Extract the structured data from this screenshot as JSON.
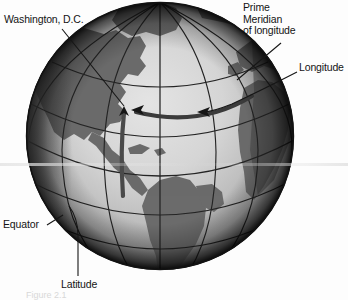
{
  "figure": {
    "type": "diagram",
    "background_color": "#fdfdfd",
    "faint_caption": "Figure 2.1"
  },
  "globe": {
    "center_x": 160,
    "center_y": 136,
    "radius": 134,
    "ocean_light": "#d9d9d9",
    "ocean_mid": "#b9b9b9",
    "land_color": "#6a6a6a",
    "land_dark": "#4e4e4e",
    "limb_dark": "#1d1d1d",
    "grid_color": "#2a2a2a",
    "highlight_color": "#3a3a3a",
    "meridian_count": 7,
    "parallel_count": 5,
    "equator_visible": true,
    "prime_meridian_visible": true,
    "highlighted_latitude_label": "latitude of Washington, D.C.",
    "highlighted_longitude_label": "longitude of Washington, D.C."
  },
  "labels": {
    "washington": "Washington, D.C.",
    "prime_meridian_line1": "Prime",
    "prime_meridian_line2": "Meridian",
    "prime_meridian_line3": "of longitude",
    "longitude": "Longitude",
    "equator": "Equator",
    "latitude": "Latitude"
  },
  "leaders": {
    "washington": "diagonal line from label down-right to arrowhead on globe at Washington, D.C.",
    "prime_meridian": "short diagonal line from label down-left to the prime meridian arc",
    "longitude": "curved line from label sweeping left to arrowhead on the highlighted latitude arc",
    "equator": "short diagonal line from label up-right to the equator line",
    "latitude": "vertical line from label up to a curved segment meeting the globe"
  }
}
